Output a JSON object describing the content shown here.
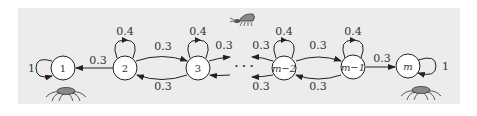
{
  "diagram": {
    "type": "markov-chain",
    "background": "#ececec",
    "nodes": [
      {
        "id": "1",
        "label": "1",
        "self_loop": "1",
        "absorbing": true
      },
      {
        "id": "2",
        "label": "2",
        "self_loop": "0.4"
      },
      {
        "id": "3",
        "label": "3",
        "self_loop": "0.4"
      },
      {
        "id": "m-2",
        "label": "m−2",
        "self_loop": "0.4"
      },
      {
        "id": "m-1",
        "label": "m−1",
        "self_loop": "0.4"
      },
      {
        "id": "m",
        "label": "m",
        "self_loop": "1",
        "absorbing": true
      }
    ],
    "edges": [
      {
        "from": "2",
        "to": "1",
        "label": "0.3"
      },
      {
        "from": "2",
        "to": "3",
        "label": "0.3"
      },
      {
        "from": "3",
        "to": "2",
        "label": "0.3"
      },
      {
        "from": "3",
        "to": "…",
        "label": "0.3"
      },
      {
        "from": "…",
        "to": "3",
        "label": "0.3"
      },
      {
        "from": "…",
        "to": "m-2",
        "label": "0.3"
      },
      {
        "from": "m-2",
        "to": "…",
        "label": "0.3"
      },
      {
        "from": "m-2",
        "to": "m-1",
        "label": "0.3"
      },
      {
        "from": "m-1",
        "to": "m-2",
        "label": "0.3"
      },
      {
        "from": "m-1",
        "to": "m",
        "label": "0.3"
      }
    ],
    "ellipsis": "· · ·",
    "icons": [
      "spider-icon-left",
      "bug-icon-top",
      "spider-icon-right"
    ]
  },
  "labels": {
    "n1": "1",
    "n2": "2",
    "n3": "3",
    "nm2": "m−2",
    "nm1": "m−1",
    "nm": "m",
    "loop1": "1",
    "loop2": "0.4",
    "loop3": "0.4",
    "loopm2": "0.4",
    "loopm1": "0.4",
    "loopm": "1",
    "e21": "0.3",
    "e23": "0.3",
    "e32": "0.3",
    "e3r": "0.3",
    "e3l": "0.3",
    "em2l": "0.3",
    "em2r": "0.3",
    "em2m1": "0.3",
    "em1m2": "0.3",
    "em1m": "0.3",
    "dots": "· · ·"
  }
}
